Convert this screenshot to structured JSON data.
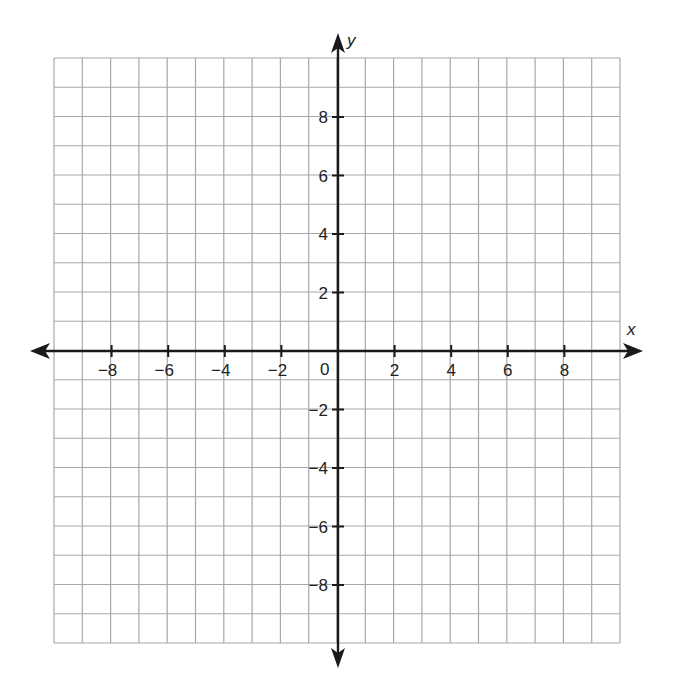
{
  "colors": {
    "grid": "#a8a8a8",
    "axis": "#1a1a1a",
    "label": "#222222",
    "background": "#ffffff"
  },
  "axes": {
    "x": {
      "name": "x",
      "min": -10,
      "max": 10,
      "tick_step": 2,
      "labels": [
        "−8",
        "−6",
        "−4",
        "−2",
        "2",
        "4",
        "6",
        "8"
      ],
      "label_values": [
        -8,
        -6,
        -4,
        -2,
        2,
        4,
        6,
        8
      ]
    },
    "y": {
      "name": "y",
      "min": -10,
      "max": 10,
      "tick_step": 2,
      "labels": [
        "8",
        "6",
        "4",
        "2",
        "−2",
        "−4",
        "−6",
        "−8"
      ],
      "label_values": [
        8,
        6,
        4,
        2,
        -2,
        -4,
        -6,
        -8
      ]
    },
    "origin_label": "0"
  },
  "grid": {
    "columns": 20,
    "rows": 20,
    "unit": 1
  },
  "chart_data": {
    "type": "scatter",
    "title": "",
    "xlabel": "x",
    "ylabel": "y",
    "xlim": [
      -10,
      10
    ],
    "ylim": [
      -10,
      10
    ],
    "x_ticks": [
      -8,
      -6,
      -4,
      -2,
      2,
      4,
      6,
      8
    ],
    "y_ticks": [
      -8,
      -6,
      -4,
      -2,
      2,
      4,
      6,
      8
    ],
    "grid": true,
    "grid_step": 1,
    "origin_label": "0",
    "series": []
  }
}
